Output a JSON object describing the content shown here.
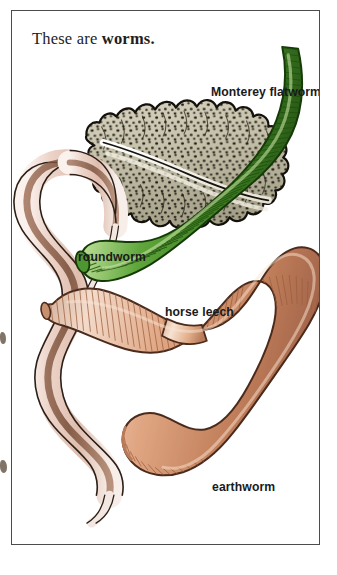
{
  "page": {
    "background": "#ffffff",
    "frame_color": "#4c4c4c"
  },
  "title": {
    "lead": "These are ",
    "emphasis": "worms."
  },
  "labels": {
    "flatworm": "Monterey flatworm",
    "roundworm": "roundworm",
    "leech": "horse leech",
    "earthworm": "earthworm"
  },
  "specimens": [
    {
      "name": "Monterey flatworm",
      "icon": "flatworm-illustration",
      "body_color": "#cfc9b4",
      "shade_color": "#8d8970",
      "spot_color": "#1d1a14",
      "outline_color": "#14110c",
      "description": "flattened ruffled-edge oval body with dense dark speckles and a pale median ridge"
    },
    {
      "name": "roundworm",
      "icon": "roundworm-illustration",
      "body_color": "#e9cfc6",
      "shade_color": "#8a5f4b",
      "outline_color": "#2b1f18",
      "description": "long smooth sinuous unsegmented worm, pale pink with a dark internal gut line"
    },
    {
      "name": "horse leech",
      "icon": "horse-leech-illustration",
      "body_color": "#5aa33a",
      "shade_color": "#2f6b1c",
      "highlight_color": "#b6d98f",
      "outline_color": "#153a08",
      "description": "thick green annulated leech curving from upper right to lower left"
    },
    {
      "name": "earthworm",
      "icon": "earthworm-illustration",
      "body_color": "#dfa584",
      "shade_color": "#a96a4a",
      "highlight_color": "#f4d7c4",
      "clitellum_color": "#e7b896",
      "outline_color": "#4a2b1c",
      "description": "segmented pinkish-brown earthworm bent in a U with a swollen clitellum band"
    }
  ]
}
